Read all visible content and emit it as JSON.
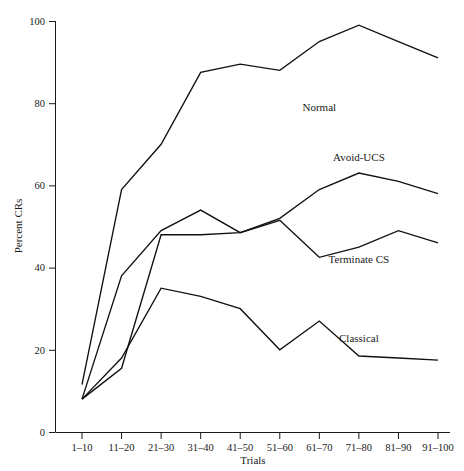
{
  "chart_data": {
    "type": "line",
    "title": "",
    "xlabel": "Trials",
    "ylabel": "Percent CRs",
    "ylim": [
      0,
      100
    ],
    "yticks": [
      0,
      20,
      40,
      60,
      80,
      100
    ],
    "grid": false,
    "legend_position": "inline-right-of-series",
    "categories": [
      "1–10",
      "11–20",
      "21–30",
      "31–40",
      "41–50",
      "51–60",
      "61–70",
      "71–80",
      "81–90",
      "91–100"
    ],
    "series": [
      {
        "name": "Normal",
        "label": "Normal",
        "values": [
          11.5,
          59,
          70,
          87.5,
          89.5,
          88,
          95,
          99,
          95,
          91
        ],
        "label_x_category": "61–70",
        "label_value": 78
      },
      {
        "name": "Avoid-UCS",
        "label": "Avoid-UCS",
        "values": [
          8,
          15.5,
          48,
          48,
          48.5,
          52,
          59,
          63,
          61,
          58
        ],
        "label_x_category": "71–80",
        "label_value": 66
      },
      {
        "name": "Terminate CS",
        "label": "Terminate CS",
        "values": [
          8,
          38,
          49,
          54,
          48.5,
          51.5,
          42.5,
          45,
          49,
          46
        ],
        "label_x_category": "71–80",
        "label_value": 41
      },
      {
        "name": "Classical",
        "label": "Classical",
        "values": [
          8,
          18,
          35,
          33,
          30,
          20,
          27,
          18.5,
          18,
          17.5
        ],
        "label_x_category": "71–80",
        "label_value": 22
      }
    ]
  },
  "axes": {
    "y_title": "Percent CRs",
    "x_title": "Trials",
    "y_tick_labels": [
      "0",
      "20",
      "40",
      "60",
      "80",
      "100"
    ],
    "x_tick_labels": [
      "1–10",
      "11–20",
      "21–30",
      "31–40",
      "41–50",
      "51–60",
      "61–70",
      "71–80",
      "81–90",
      "91–100"
    ]
  },
  "colors": {
    "line": "#111111",
    "axis": "#1a1a1a",
    "text": "#1a1a1a",
    "background": "#ffffff"
  }
}
